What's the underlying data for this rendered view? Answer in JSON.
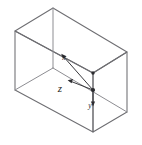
{
  "figure": {
    "background_color": "#ffffff",
    "edge_color": "#6e6e72",
    "axis_color": "#2c2c30",
    "label_color": "#1f1f22"
  },
  "axes": {
    "origin_label": "",
    "x": {
      "label": "x",
      "label_x": 64,
      "label_y": 60,
      "from_x": 93,
      "from_y": 90,
      "to_x": 60,
      "to_y": 53
    },
    "y": {
      "label": "y",
      "label_x": 90,
      "label_y": 107,
      "from_x": 93,
      "from_y": 90,
      "to_x": 93,
      "to_y": 103
    },
    "z": {
      "label": "z",
      "label_x": 60,
      "label_y": 92,
      "from_x": 93,
      "from_y": 90,
      "to_x": 69,
      "to_y": 81
    }
  },
  "box": {
    "vertices": {
      "top_near_left": [
        15,
        31
      ],
      "top_near_right": [
        93,
        29
      ],
      "top_far_top": [
        53,
        8
      ],
      "top_far_right": [
        127,
        52
      ],
      "bottom_near_left": [
        15,
        90
      ],
      "bottom_near_right": [
        93,
        132
      ],
      "bottom_far_left": [
        53,
        68
      ],
      "bottom_far_right": [
        127,
        112
      ]
    }
  }
}
